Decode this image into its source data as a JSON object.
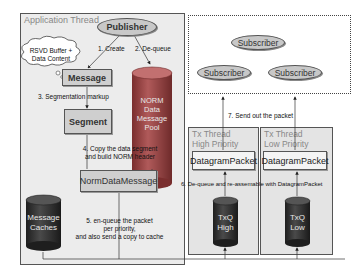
{
  "application_thread": {
    "title": "Application Thread",
    "publisher": "Publisher",
    "cloud": {
      "line1": "RSVD Buffer +",
      "line2": "Data Content"
    },
    "message": "Message",
    "segment": "Segment",
    "norm_data_message": "NormDataMessage",
    "norm_pool": {
      "line1": "NORM",
      "line2": "Data",
      "line3": "Message",
      "line4": "Pool"
    },
    "message_caches": {
      "line1": "Message",
      "line2": "Caches"
    },
    "steps": {
      "create": "1. Create",
      "dequeue": "2. De-queue",
      "segmentation": "3. Segmentation markup",
      "copy_line1": "4. Copy the data segment",
      "copy_line2": "and build NORM header",
      "enqueue_line1": "5. en-queue the packet",
      "enqueue_line2": "per priority,",
      "enqueue_line3": "and also send a copy to cache"
    }
  },
  "subscribers": [
    "Subscriber",
    "Subscriber",
    "Subscriber"
  ],
  "send_out": "7. Send out the packet",
  "reassemble": "6. De-queue and re-assemable with DatagramPacket",
  "tx_high": {
    "title_line1": "Tx Thread",
    "title_line2": "High Priority",
    "packet": "DatagramPacket",
    "queue_line1": "TxQ",
    "queue_line2": "High"
  },
  "tx_low": {
    "title_line1": "Tx Thread",
    "title_line2": "Low Priority",
    "packet": "DatagramPacket",
    "queue_line1": "TxQ",
    "queue_line2": "Low"
  },
  "colors": {
    "panel": "#ececec",
    "box": "#cfcfcf",
    "cylinder_red": "#9c4a4a",
    "cylinder_dark": "#333333"
  }
}
